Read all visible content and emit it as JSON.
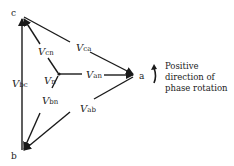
{
  "vertices": {
    "a": {
      "label": "a"
    },
    "b": {
      "label": "b"
    },
    "c": {
      "label": "c"
    }
  },
  "phasors": {
    "ca": {
      "main": "V",
      "sub": "ca"
    },
    "cn": {
      "main": "V",
      "sub": "cn"
    },
    "bc": {
      "main": "V",
      "sub": "bc"
    },
    "n": {
      "main": "V",
      "sub": "n"
    },
    "an": {
      "main": "V",
      "sub": "an"
    },
    "bn": {
      "main": "V",
      "sub": "bn"
    },
    "ab": {
      "main": "V",
      "sub": "ab"
    }
  },
  "annotation": {
    "line1": "Positive",
    "line2": "direction of",
    "line3": "phase rotation"
  },
  "colors": {
    "stroke": "#1a1a1a",
    "text": "#222222"
  }
}
